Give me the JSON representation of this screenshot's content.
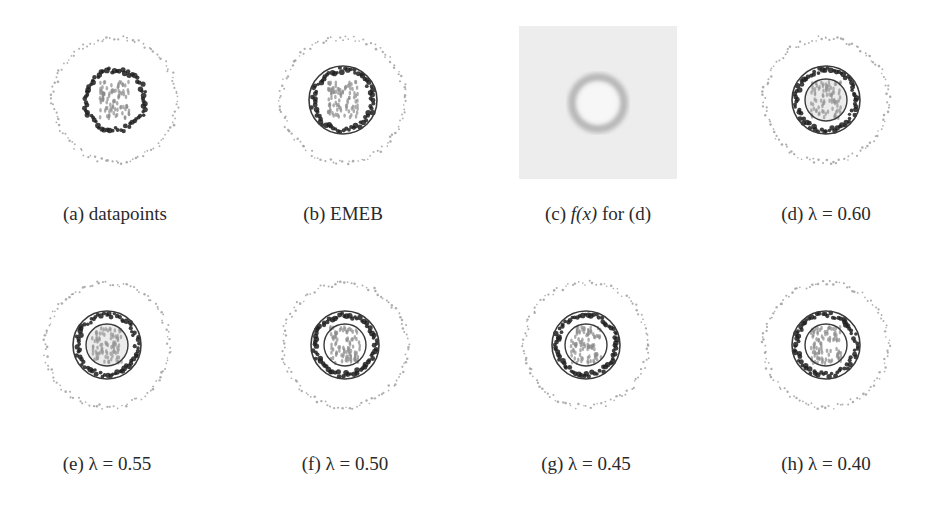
{
  "figure": {
    "panels": [
      {
        "id": "a",
        "label": "(a)",
        "caption": "datapoints",
        "type": "datapoints",
        "cx": 115,
        "cy": 100,
        "cap_x": 115,
        "cap_y": 203
      },
      {
        "id": "b",
        "label": "(b)",
        "caption": "EMEB",
        "type": "emeb",
        "cx": 343,
        "cy": 100,
        "cap_x": 343,
        "cap_y": 203
      },
      {
        "id": "c",
        "label": "(c)",
        "caption_prefix": "f(x)",
        "caption": "for (d)",
        "type": "density",
        "cx": 598,
        "cy": 103,
        "cap_x": 598,
        "cap_y": 203
      },
      {
        "id": "d",
        "label": "(d)",
        "caption": "λ = 0.60",
        "lambda": 0.6,
        "type": "lambda",
        "cx": 826,
        "cy": 100,
        "cap_x": 826,
        "cap_y": 203
      },
      {
        "id": "e",
        "label": "(e)",
        "caption": "λ = 0.55",
        "lambda": 0.55,
        "type": "lambda",
        "cx": 107,
        "cy": 345,
        "cap_x": 107,
        "cap_y": 453
      },
      {
        "id": "f",
        "label": "(f)",
        "caption": "λ = 0.50",
        "lambda": 0.5,
        "type": "lambda",
        "cx": 345,
        "cy": 345,
        "cap_x": 345,
        "cap_y": 453
      },
      {
        "id": "g",
        "label": "(g)",
        "caption": "λ = 0.45",
        "lambda": 0.45,
        "type": "lambda",
        "cx": 586,
        "cy": 345,
        "cap_x": 586,
        "cap_y": 453
      },
      {
        "id": "h",
        "label": "(h)",
        "caption": "λ = 0.40",
        "lambda": 0.4,
        "type": "lambda",
        "cx": 826,
        "cy": 345,
        "cap_x": 826,
        "cap_y": 453
      }
    ]
  },
  "colors": {
    "outer_ring": "#9a9a9a",
    "middle_ring": "#1e1e1e",
    "inner_cluster": "#8a8a8a",
    "boundary": "#3a3a3a",
    "density_bg": "#ededed",
    "density_ring": "#b8b8b8"
  }
}
